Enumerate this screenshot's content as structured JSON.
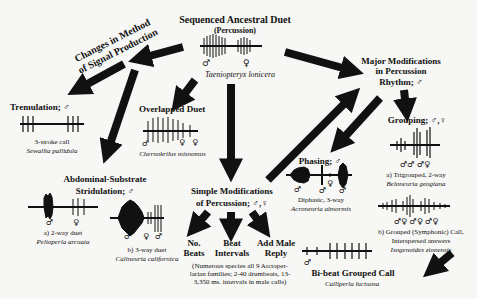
{
  "diagram": {
    "root": {
      "title": "Sequenced Ancestral Duet",
      "subtitle": "(Percussion)",
      "species": "Taeniopteryx lonicera",
      "symbols": [
        "♂",
        "♀"
      ]
    },
    "branch_signal": {
      "title_line1": "Changes in Method",
      "title_line2": "of Signal Production"
    },
    "tremulation": {
      "title": "Tremulation; ♂",
      "caption": "3-stroke call",
      "species": "Sewallia pallidula"
    },
    "overlapped": {
      "title": "Overlapped Duet",
      "species": "Chernokrilus misnomus",
      "symbols": [
        "♂",
        "♀",
        "♀"
      ]
    },
    "stridulation": {
      "title_line1": "Abdominal-Substrate",
      "title_line2": "Stridulation; ♂",
      "a_caption": "a) 2-way duet",
      "a_species": "Peltoperla arcuata",
      "a_symbols": [
        "♂",
        "♀"
      ],
      "b_caption": "b) 3-way duet",
      "b_species": "Calineuria californica",
      "b_symbols": [
        "♂",
        "♀",
        "♂"
      ]
    },
    "simple": {
      "title_line1": "Simple Modifications",
      "title_line2": "of Percussion; ♂,♀",
      "options": [
        {
          "line1": "No.",
          "line2": "Beats"
        },
        {
          "line1": "Beat",
          "line2": "Intervals"
        },
        {
          "line1": "Add Male",
          "line2": "Reply"
        }
      ],
      "note_line1": "(Numerous species all 9 Arctoper-",
      "note_line2": "larian families; 2-40 drumbeats, 13-",
      "note_line3": "3,350 ms. intervals in male calls)"
    },
    "major": {
      "title_line1": "Major Modifications",
      "title_line2": "in Percussion",
      "title_line3": "Rhythm; ♂"
    },
    "phasing": {
      "title": "Phasing; ♂",
      "caption": "Diphasic, 3-way",
      "species": "Acroneuria abnormis",
      "symbols": [
        "♂",
        "♀",
        "♂",
        "♂"
      ]
    },
    "grouping": {
      "title": "Grouping; ♂,♀",
      "a_symbols": "♂♂ ♂♀",
      "a_caption": "a) Trigrouped, 2-way",
      "a_species": "Beloneuria geogiana",
      "b_symbols": "♂♀  ♂♀  ♂♀",
      "b_caption_line1": "b) Grouped (Symphonic) Call,",
      "b_caption_line2": "Interspersed answers",
      "b_species": "Isogenoides zionensis"
    },
    "bibeat": {
      "title": "Bi-beat Grouped Call",
      "species": "Calliperla luctuosa",
      "symbol": "♂"
    },
    "colors": {
      "background": "#f7f7f5",
      "ink": "#111111"
    }
  }
}
